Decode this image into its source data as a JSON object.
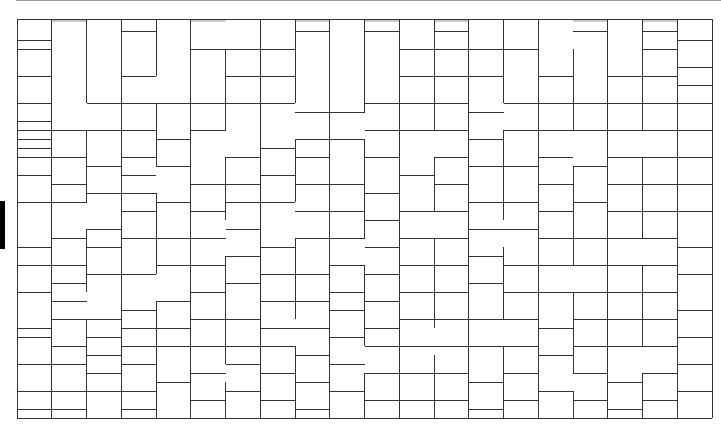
{
  "canvas": {
    "width": 721,
    "height": 440,
    "background": "#ffffff"
  },
  "grid": {
    "origin_x": 17,
    "origin_y": 22,
    "top_band_y": 19,
    "col_width": 34.75,
    "row_height": 9,
    "cols": 20,
    "rows": 44,
    "stroke": "#333333",
    "band_fill": "#c8c8c8"
  },
  "columns": [
    {
      "c": 0,
      "h": [
        0,
        2,
        3,
        6,
        9,
        11,
        12,
        13,
        14,
        15,
        17,
        20,
        25,
        27,
        30,
        34,
        35,
        38,
        41,
        43
      ]
    },
    {
      "c": 1,
      "h": [
        0,
        12,
        15,
        18,
        20,
        24,
        27,
        29,
        31,
        33,
        36,
        38,
        41,
        43
      ]
    },
    {
      "c": 2,
      "h": [
        0,
        9,
        12,
        16,
        19,
        23,
        25,
        28,
        33,
        35,
        37,
        39,
        41
      ]
    },
    {
      "c": 3,
      "h": [
        0,
        1,
        6,
        9,
        12,
        15,
        17,
        19,
        21,
        24,
        28,
        32,
        34,
        36,
        38,
        41,
        43
      ]
    },
    {
      "c": 4,
      "h": [
        0,
        9,
        13,
        16,
        20,
        24,
        27,
        31,
        34,
        36,
        40
      ]
    },
    {
      "c": 5,
      "h": [
        0,
        3,
        9,
        12,
        18,
        21,
        24,
        27,
        30,
        33,
        36,
        39,
        42
      ]
    },
    {
      "c": 6,
      "h": [
        0,
        3,
        6,
        9,
        15,
        18,
        20,
        23,
        26,
        29,
        33,
        36,
        38,
        41
      ]
    },
    {
      "c": 7,
      "h": [
        0,
        3,
        6,
        9,
        14,
        17,
        20,
        25,
        28,
        31,
        34,
        36,
        39,
        42
      ]
    },
    {
      "c": 8,
      "h": [
        0,
        1,
        10,
        13,
        15,
        18,
        21,
        24,
        28,
        31,
        34,
        37,
        40,
        43
      ]
    },
    {
      "c": 9,
      "h": [
        0,
        10,
        13,
        18,
        21,
        24,
        27,
        30,
        32,
        35,
        38,
        41
      ]
    },
    {
      "c": 10,
      "h": [
        0,
        1,
        9,
        12,
        15,
        19,
        22,
        25,
        28,
        31,
        34,
        36,
        39,
        42
      ]
    },
    {
      "c": 11,
      "h": [
        0,
        3,
        6,
        9,
        12,
        17,
        21,
        24,
        27,
        30,
        33,
        36,
        39,
        42
      ]
    },
    {
      "c": 12,
      "h": [
        0,
        1,
        3,
        6,
        9,
        12,
        15,
        18,
        21,
        24,
        27,
        30,
        33,
        36,
        39,
        42
      ]
    },
    {
      "c": 13,
      "h": [
        0,
        3,
        6,
        10,
        13,
        16,
        20,
        23,
        26,
        29,
        33,
        36,
        40,
        43
      ]
    },
    {
      "c": 14,
      "h": [
        0,
        3,
        9,
        12,
        16,
        20,
        23,
        27,
        30,
        33,
        36,
        39,
        42
      ]
    },
    {
      "c": 15,
      "h": [
        0,
        6,
        9,
        12,
        15,
        18,
        21,
        24,
        27,
        30,
        34,
        37,
        41
      ]
    },
    {
      "c": 16,
      "h": [
        0,
        1,
        9,
        12,
        16,
        20,
        24,
        27,
        30,
        33,
        36,
        39,
        42
      ]
    },
    {
      "c": 17,
      "h": [
        0,
        6,
        9,
        12,
        15,
        18,
        21,
        24,
        27,
        30,
        33,
        36,
        40,
        43
      ]
    },
    {
      "c": 18,
      "h": [
        0,
        1,
        3,
        6,
        9,
        12,
        15,
        18,
        21,
        24,
        27,
        30,
        33,
        36,
        39,
        42
      ]
    },
    {
      "c": 19,
      "h": [
        0,
        2,
        5,
        7,
        9,
        12,
        15,
        18,
        21,
        25,
        28,
        32,
        35,
        38,
        41
      ]
    }
  ],
  "vertical_breaks": [
    {
      "c": 1,
      "rows": [
        [
          0,
          44
        ]
      ]
    },
    {
      "c": 2,
      "rows": [
        [
          0,
          9
        ],
        [
          12,
          20
        ],
        [
          23,
          30
        ],
        [
          33,
          44
        ]
      ]
    },
    {
      "c": 3,
      "rows": [
        [
          0,
          44
        ]
      ]
    },
    {
      "c": 4,
      "rows": [
        [
          0,
          6
        ],
        [
          9,
          16
        ],
        [
          19,
          28
        ],
        [
          31,
          44
        ]
      ]
    },
    {
      "c": 5,
      "rows": [
        [
          0,
          44
        ]
      ]
    },
    {
      "c": 6,
      "rows": [
        [
          3,
          12
        ],
        [
          15,
          22
        ],
        [
          26,
          38
        ],
        [
          40,
          44
        ]
      ]
    },
    {
      "c": 7,
      "rows": [
        [
          0,
          44
        ]
      ]
    },
    {
      "c": 8,
      "rows": [
        [
          0,
          9
        ],
        [
          13,
          20
        ],
        [
          24,
          33
        ],
        [
          36,
          44
        ]
      ]
    },
    {
      "c": 9,
      "rows": [
        [
          0,
          44
        ]
      ]
    },
    {
      "c": 10,
      "rows": [
        [
          0,
          10
        ],
        [
          13,
          24
        ],
        [
          27,
          36
        ],
        [
          39,
          44
        ]
      ]
    },
    {
      "c": 11,
      "rows": [
        [
          0,
          44
        ]
      ]
    },
    {
      "c": 12,
      "rows": [
        [
          0,
          12
        ],
        [
          15,
          21
        ],
        [
          24,
          34
        ],
        [
          37,
          44
        ]
      ]
    },
    {
      "c": 13,
      "rows": [
        [
          0,
          44
        ]
      ]
    },
    {
      "c": 14,
      "rows": [
        [
          0,
          9
        ],
        [
          12,
          22
        ],
        [
          25,
          33
        ],
        [
          36,
          44
        ]
      ]
    },
    {
      "c": 15,
      "rows": [
        [
          0,
          44
        ]
      ]
    },
    {
      "c": 16,
      "rows": [
        [
          3,
          12
        ],
        [
          16,
          27
        ],
        [
          30,
          39
        ],
        [
          41,
          44
        ]
      ]
    },
    {
      "c": 17,
      "rows": [
        [
          0,
          44
        ]
      ]
    },
    {
      "c": 18,
      "rows": [
        [
          0,
          12
        ],
        [
          15,
          24
        ],
        [
          27,
          36
        ],
        [
          39,
          44
        ]
      ]
    },
    {
      "c": 19,
      "rows": [
        [
          0,
          44
        ]
      ]
    },
    {
      "c": 20,
      "rows": [
        [
          0,
          44
        ]
      ]
    },
    {
      "c": 0,
      "rows": [
        [
          0,
          44
        ]
      ]
    }
  ],
  "decorations": {
    "top_rule": {
      "x": 16,
      "y": 0,
      "w": 705,
      "color": "#9a9a9a"
    },
    "left_bar": {
      "x": 0,
      "y": 201,
      "w": 5,
      "h": 48,
      "color": "#000000"
    }
  }
}
